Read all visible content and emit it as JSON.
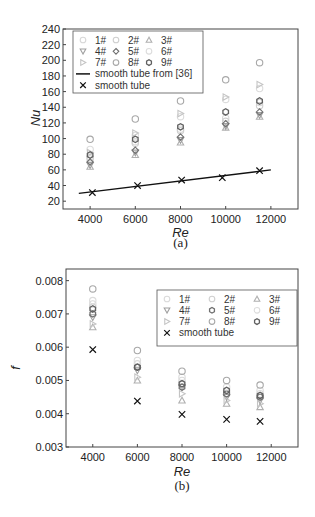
{
  "chart_data": [
    {
      "id": "a",
      "type": "scatter",
      "caption": "(a)",
      "title": "",
      "xlabel": "Re",
      "ylabel": "Nu",
      "xlim": [
        2800,
        13200
      ],
      "ylim": [
        10,
        240
      ],
      "xticks": [
        4000,
        6000,
        8000,
        10000,
        12000
      ],
      "yticks": [
        20,
        40,
        60,
        80,
        100,
        120,
        140,
        160,
        180,
        200,
        220,
        240
      ],
      "grid": false,
      "legend_position": "upper left",
      "legend": [
        "1#",
        "2#",
        "3#",
        "4#",
        "5#",
        "6#",
        "7#",
        "8#",
        "9#",
        "smooth tube from [36]",
        "smooth tube"
      ],
      "x": [
        4000,
        6000,
        8000,
        10000,
        11500
      ],
      "series": [
        {
          "name": "1#",
          "marker": "circle",
          "color": "#d8d8d8",
          "values": [
            76,
            96,
            112,
            126,
            146
          ]
        },
        {
          "name": "2#",
          "marker": "circle",
          "color": "#cfcfcf",
          "values": [
            74,
            94,
            110,
            122,
            142
          ]
        },
        {
          "name": "3#",
          "marker": "triangle-up",
          "color": "#b0b0b0",
          "values": [
            64,
            79,
            95,
            114,
            128
          ]
        },
        {
          "name": "4#",
          "marker": "triangle-down",
          "color": "#a0a0a0",
          "values": [
            66,
            82,
            98,
            116,
            130
          ]
        },
        {
          "name": "5#",
          "marker": "diamond",
          "color": "#707070",
          "values": [
            70,
            85,
            102,
            119,
            134
          ]
        },
        {
          "name": "6#",
          "marker": "circle",
          "color": "#dcdcdc",
          "values": [
            86,
            104,
            128,
            150,
            164
          ]
        },
        {
          "name": "7#",
          "marker": "triangle-right",
          "color": "#c4c4c4",
          "values": [
            82,
            107,
            132,
            153,
            169
          ]
        },
        {
          "name": "8#",
          "marker": "circle",
          "color": "#a8a8a8",
          "values": [
            99,
            125,
            148,
            175,
            197
          ]
        },
        {
          "name": "9#",
          "marker": "hexagon",
          "color": "#606060",
          "values": [
            79,
            99,
            115,
            134,
            148
          ]
        },
        {
          "name": "smooth tube from [36]",
          "marker": "line",
          "color": "#111111",
          "x": [
            3500,
            12000
          ],
          "values": [
            30,
            60
          ]
        },
        {
          "name": "smooth tube",
          "marker": "x",
          "color": "#111111",
          "x": [
            4100,
            6100,
            8050,
            9850,
            11500
          ],
          "values": [
            31,
            40,
            47,
            50,
            59
          ]
        }
      ]
    },
    {
      "id": "b",
      "type": "scatter",
      "caption": "(b)",
      "title": "",
      "xlabel": "Re",
      "ylabel": "f",
      "xlim": [
        2800,
        13200
      ],
      "ylim": [
        0.003,
        0.00835
      ],
      "xticks": [
        4000,
        6000,
        8000,
        10000,
        12000
      ],
      "yticks": [
        0.003,
        0.004,
        0.005,
        0.006,
        0.007,
        0.008
      ],
      "grid": false,
      "legend_position": "upper right",
      "legend": [
        "1#",
        "2#",
        "3#",
        "4#",
        "5#",
        "6#",
        "7#",
        "8#",
        "9#",
        "smooth tube"
      ],
      "x": [
        4000,
        6000,
        8000,
        10000,
        11500
      ],
      "series": [
        {
          "name": "1#",
          "marker": "circle",
          "color": "#dadada",
          "values": [
            0.0073,
            0.0055,
            0.005,
            0.0047,
            0.0046
          ]
        },
        {
          "name": "2#",
          "marker": "circle",
          "color": "#d0d0d0",
          "values": [
            0.0072,
            0.0054,
            0.0049,
            0.0046,
            0.0045
          ]
        },
        {
          "name": "3#",
          "marker": "triangle-up",
          "color": "#b0b0b0",
          "values": [
            0.0066,
            0.005,
            0.0044,
            0.0043,
            0.0042
          ]
        },
        {
          "name": "4#",
          "marker": "triangle-down",
          "color": "#a0a0a0",
          "values": [
            0.0069,
            0.0053,
            0.0048,
            0.0045,
            0.0044
          ]
        },
        {
          "name": "5#",
          "marker": "hexagon",
          "color": "#707070",
          "values": [
            0.007,
            0.0054,
            0.0048,
            0.0046,
            0.0045
          ]
        },
        {
          "name": "6#",
          "marker": "circle",
          "color": "#dcdcdc",
          "values": [
            0.0074,
            0.0056,
            0.0051,
            0.0048,
            0.0047
          ]
        },
        {
          "name": "7#",
          "marker": "triangle-right",
          "color": "#c4c4c4",
          "values": [
            0.0067,
            0.0051,
            0.0046,
            0.0044,
            0.0043
          ]
        },
        {
          "name": "8#",
          "marker": "circle",
          "color": "#a8a8a8",
          "values": [
            0.00775,
            0.0059,
            0.00528,
            0.005,
            0.00486
          ]
        },
        {
          "name": "9#",
          "marker": "hexagon",
          "color": "#606060",
          "values": [
            0.00715,
            0.0054,
            0.0049,
            0.0047,
            0.00455
          ]
        },
        {
          "name": "smooth tube",
          "marker": "x",
          "color": "#111111",
          "values": [
            0.00593,
            0.00438,
            0.00398,
            0.00383,
            0.00377
          ]
        }
      ]
    }
  ]
}
